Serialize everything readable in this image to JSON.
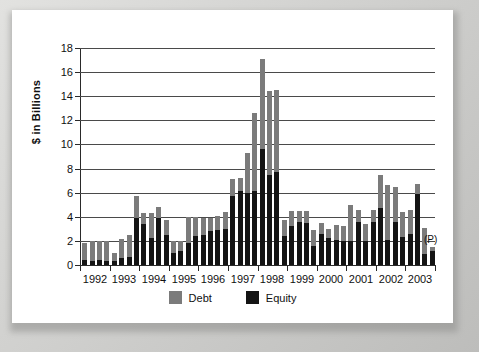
{
  "chart_data": {
    "type": "bar",
    "title": "",
    "subtitle": "",
    "xlabel": "",
    "ylabel": "$ in Billions",
    "ylim": [
      0,
      18
    ],
    "yticks": [
      0,
      2,
      4,
      6,
      8,
      10,
      12,
      14,
      16,
      18
    ],
    "grid": true,
    "stacked": true,
    "legend_position": "bottom",
    "annotations": [
      {
        "text": "(P)",
        "meaning": "preliminary",
        "near_x": "2003 Q4"
      }
    ],
    "categories": [
      "1992 Q1",
      "1992 Q2",
      "1992 Q3",
      "1992 Q4",
      "1993 Q1",
      "1993 Q2",
      "1993 Q3",
      "1993 Q4",
      "1994 Q1",
      "1994 Q2",
      "1994 Q3",
      "1994 Q4",
      "1995 Q1",
      "1995 Q2",
      "1995 Q3",
      "1995 Q4",
      "1996 Q1",
      "1996 Q2",
      "1996 Q3",
      "1996 Q4",
      "1997 Q1",
      "1997 Q2",
      "1997 Q3",
      "1997 Q4",
      "1998 Q1",
      "1998 Q2",
      "1998 Q3",
      "1998 Q4",
      "1999 Q1",
      "1999 Q2",
      "1999 Q3",
      "1999 Q4",
      "2000 Q1",
      "2000 Q2",
      "2000 Q3",
      "2000 Q4",
      "2001 Q1",
      "2001 Q2",
      "2001 Q3",
      "2001 Q4",
      "2002 Q1",
      "2002 Q2",
      "2002 Q3",
      "2002 Q4",
      "2003 Q1",
      "2003 Q2",
      "2003 Q3",
      "2003 Q4"
    ],
    "xtick_labels": [
      "1992",
      "1993",
      "1994",
      "1995",
      "1996",
      "1997",
      "1998",
      "1999",
      "2000",
      "2001",
      "2002",
      "2003"
    ],
    "series": [
      {
        "name": "Equity",
        "color": "#141414",
        "values": [
          0.4,
          0.3,
          0.4,
          0.3,
          0.3,
          0.6,
          0.7,
          3.9,
          3.4,
          2.2,
          3.9,
          2.5,
          1.0,
          1.2,
          1.8,
          2.4,
          2.5,
          2.8,
          2.9,
          3.0,
          5.7,
          6.1,
          6.0,
          6.1,
          9.6,
          7.5,
          7.7,
          2.4,
          3.2,
          3.6,
          3.5,
          1.6,
          2.6,
          2.2,
          2.1,
          2.0,
          2.0,
          3.6,
          2.0,
          3.6,
          4.7,
          2.1,
          3.6,
          2.3,
          2.6,
          5.9,
          0.9,
          1.2
        ]
      },
      {
        "name": "Debt",
        "color": "#7b7b7b",
        "values": [
          1.4,
          1.7,
          1.6,
          1.7,
          0.7,
          1.6,
          1.8,
          1.8,
          0.9,
          2.1,
          0.9,
          1.2,
          1.0,
          0.8,
          2.2,
          1.6,
          1.4,
          1.1,
          1.2,
          1.4,
          1.4,
          1.1,
          3.3,
          6.5,
          7.5,
          6.9,
          6.8,
          1.3,
          1.3,
          0.9,
          1.0,
          1.3,
          0.9,
          0.8,
          1.2,
          1.2,
          3.0,
          1.0,
          1.4,
          1.0,
          2.8,
          4.5,
          2.9,
          2.1,
          2.0,
          0.8,
          2.2,
          0.3
        ]
      }
    ],
    "totals": [
      1.8,
      2.0,
      2.0,
      2.0,
      1.0,
      2.2,
      2.5,
      5.7,
      4.3,
      4.3,
      4.8,
      3.7,
      2.0,
      2.0,
      4.0,
      4.0,
      3.9,
      3.9,
      4.1,
      4.4,
      7.1,
      7.2,
      9.3,
      12.6,
      17.1,
      14.4,
      14.5,
      3.7,
      4.5,
      4.5,
      4.5,
      2.9,
      3.5,
      3.0,
      3.3,
      3.2,
      5.0,
      4.6,
      3.4,
      4.6,
      7.5,
      6.6,
      6.5,
      4.4,
      4.6,
      6.7,
      3.1,
      1.5
    ]
  },
  "legend": {
    "items": [
      {
        "label": "Debt",
        "color": "#7b7b7b"
      },
      {
        "label": "Equity",
        "color": "#141414"
      }
    ]
  },
  "annotation": {
    "preliminary": "(P)"
  }
}
